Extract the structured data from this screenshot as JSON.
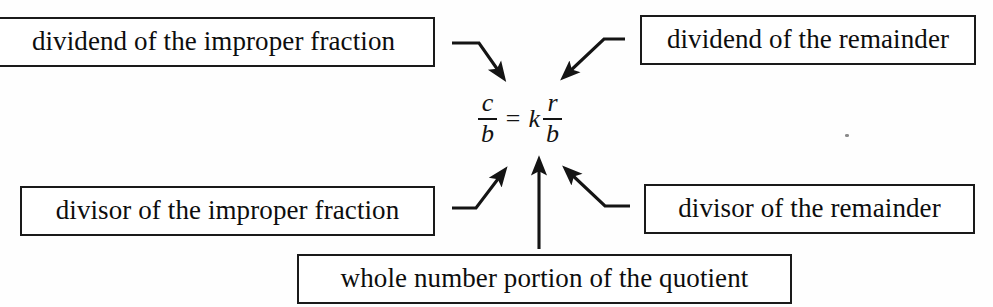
{
  "diagram": {
    "background_color": "#fefefe",
    "ink_color": "#101010",
    "formula": {
      "left_fraction": {
        "numerator": "c",
        "denominator": "b"
      },
      "equals": "=",
      "whole_number": "k",
      "right_fraction": {
        "numerator": "r",
        "denominator": "b"
      },
      "plain_text": "c/b = k r/b"
    },
    "labels": [
      {
        "id": "dividend-improper",
        "text": "dividend of the improper fraction",
        "points_to": "c",
        "position": "top-left"
      },
      {
        "id": "dividend-remainder",
        "text": "dividend of the remainder",
        "points_to": "r",
        "position": "top-right"
      },
      {
        "id": "divisor-improper",
        "text": "divisor of the improper fraction",
        "points_to": "b (left denominator)",
        "position": "bottom-left"
      },
      {
        "id": "divisor-remainder",
        "text": "divisor of the remainder",
        "points_to": "b (right denominator)",
        "position": "bottom-right"
      },
      {
        "id": "whole-number",
        "text": "whole number portion of the quotient",
        "points_to": "k",
        "position": "bottom-center"
      }
    ],
    "arrows": [
      {
        "id": "arrow-to-c",
        "from": "dividend-improper",
        "to": "c",
        "style": "elbow-then-diagonal-down-right"
      },
      {
        "id": "arrow-to-r",
        "from": "dividend-remainder",
        "to": "r",
        "style": "elbow-then-diagonal-down-left"
      },
      {
        "id": "arrow-to-b-left",
        "from": "divisor-improper",
        "to": "b-left",
        "style": "elbow-then-diagonal-up-right"
      },
      {
        "id": "arrow-to-b-right",
        "from": "divisor-remainder",
        "to": "b-right",
        "style": "elbow-then-diagonal-up-left"
      },
      {
        "id": "arrow-to-k",
        "from": "whole-number",
        "to": "k",
        "style": "straight-vertical-up"
      }
    ]
  }
}
